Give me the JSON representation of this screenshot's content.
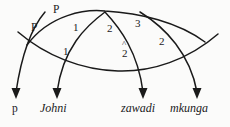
{
  "diagram": {
    "type": "syntactic-derivation-arc-diagram",
    "background_color": "#fbfbfa",
    "ink_color": "#1a1a1a",
    "node_labels": [
      {
        "id": "p-upper",
        "text": "P",
        "x": 57,
        "y": 8
      },
      {
        "id": "p-lower",
        "text": "P",
        "x": 35,
        "y": 26
      },
      {
        "id": "one-upper",
        "text": "1",
        "x": 76,
        "y": 26
      },
      {
        "id": "two-upper",
        "text": "2",
        "x": 110,
        "y": 27
      },
      {
        "id": "three",
        "text": "3",
        "x": 138,
        "y": 22
      },
      {
        "id": "two-right",
        "text": "2",
        "x": 162,
        "y": 40
      },
      {
        "id": "one-lower",
        "text": "1",
        "x": 66,
        "y": 50
      },
      {
        "id": "two-hat",
        "text": "2",
        "x": 125,
        "y": 52
      }
    ],
    "hat_mark": {
      "over_node": "two-hat",
      "x": 125,
      "y": 44,
      "glyph": "^"
    },
    "leaf_labels": [
      {
        "id": "leaf-p",
        "text": "p",
        "x": 12,
        "y": 108,
        "style": "roman"
      },
      {
        "id": "leaf-johni",
        "text": "Johni",
        "x": 42,
        "y": 107,
        "style": "italic"
      },
      {
        "id": "leaf-zawadi",
        "text": "zawadi",
        "x": 123,
        "y": 107,
        "style": "italic"
      },
      {
        "id": "leaf-mkunga",
        "text": "mkunga",
        "x": 172,
        "y": 107,
        "style": "italic"
      }
    ],
    "arrow_tips": [
      {
        "id": "arrow-p",
        "x": 16,
        "y": 98
      },
      {
        "id": "arrow-johni",
        "x": 57,
        "y": 98
      },
      {
        "id": "arrow-zawadi",
        "x": 143,
        "y": 98
      },
      {
        "id": "arrow-mkunga",
        "x": 197,
        "y": 98
      }
    ],
    "descending_curves": [
      {
        "id": "curve-p",
        "path": "M 45 12 C 33 26, 22 52, 16 92"
      },
      {
        "id": "curve-johni",
        "path": "M 105 12 C 86 26, 63 48, 57 92"
      },
      {
        "id": "curve-zawadi",
        "path": "M 105 12 C 120 28, 138 52, 143 92"
      },
      {
        "id": "curve-mkunga",
        "path": "M 140 12 C 166 28, 190 54, 197 92"
      }
    ],
    "arcs": [
      {
        "id": "arc-upper",
        "path": "M 27 45 C 50 14, 86 9, 105 11 C 140 13, 178 22, 205 42"
      },
      {
        "id": "arc-lower",
        "path": "M 18 32 C 46 56, 82 70, 118 71 C 152 72, 188 60, 218 34"
      }
    ]
  }
}
